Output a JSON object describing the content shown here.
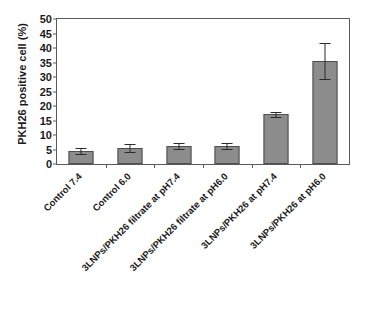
{
  "chart_data": {
    "type": "bar",
    "title": "",
    "xlabel": "",
    "ylabel": "PKH26 positive cell (%)",
    "ylim": [
      0,
      50
    ],
    "yticks": [
      0,
      5,
      10,
      15,
      20,
      25,
      30,
      35,
      40,
      45,
      50
    ],
    "grid": false,
    "legend": null,
    "bar_color": "#8c8c8c",
    "bar_edge_color": "#4f4f4f",
    "categories": [
      "Control 7.4",
      "Control 6.0",
      "3LNPs/PKH26 filtrate at pH7.4",
      "3LNPs/PKH26 filtrate at pH6.0",
      "3LNPs/PKH26 at pH7.4",
      "3LNPs/PKH26 at pH6.0"
    ],
    "values": [
      4.5,
      5.6,
      6.3,
      6.3,
      17.2,
      35.5
    ],
    "errors": [
      0.9,
      1.3,
      1.1,
      1.1,
      0.9,
      6.3
    ]
  }
}
